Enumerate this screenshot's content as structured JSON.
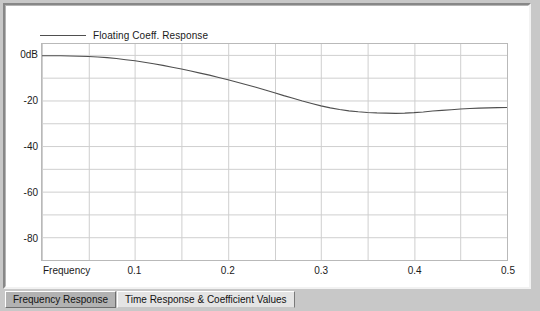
{
  "window": {
    "background_color": "#c8c8c8",
    "panel_background": "#ffffff"
  },
  "legend": {
    "position": "top-left",
    "entries": [
      {
        "label": "Floating Coeff. Response",
        "color": "#4f4f4f",
        "swatch_name": "legend-line-swatch"
      }
    ]
  },
  "axes": {
    "x_title": "Frequency",
    "x_ticks": [
      "0.1",
      "0.2",
      "0.3",
      "0.4",
      "0.5"
    ],
    "x_tick_values": [
      0.1,
      0.2,
      0.3,
      0.4,
      0.5
    ],
    "y_ticks": [
      "0dB",
      "-20",
      "-40",
      "-60",
      "-80"
    ],
    "y_tick_values": [
      0,
      -20,
      -40,
      -60,
      -80
    ]
  },
  "tabs": [
    {
      "label": "Frequency Response",
      "selected": false,
      "name": "tab-frequency-response"
    },
    {
      "label": "Time Response & Coefficient Values",
      "selected": true,
      "name": "tab-time-response-coefficient-values"
    }
  ],
  "chart_data": {
    "type": "line",
    "title": "",
    "subtitle": "",
    "xlabel": "Frequency",
    "ylabel": "",
    "xlim": [
      0.0,
      0.5
    ],
    "ylim": [
      -90,
      5
    ],
    "grid": true,
    "grid_x_step": 0.05,
    "grid_y_step": 10,
    "legend_position": "top-left",
    "series": [
      {
        "name": "Floating Coeff. Response",
        "color": "#4f4f4f",
        "x": [
          0.0,
          0.01,
          0.02,
          0.03,
          0.04,
          0.05,
          0.06,
          0.07,
          0.08,
          0.09,
          0.1,
          0.11,
          0.12,
          0.13,
          0.14,
          0.15,
          0.16,
          0.17,
          0.18,
          0.19,
          0.2,
          0.21,
          0.22,
          0.23,
          0.24,
          0.25,
          0.26,
          0.27,
          0.28,
          0.29,
          0.3,
          0.31,
          0.32,
          0.33,
          0.34,
          0.35,
          0.36,
          0.37,
          0.38,
          0.39,
          0.4,
          0.41,
          0.42,
          0.43,
          0.44,
          0.45,
          0.46,
          0.47,
          0.48,
          0.49,
          0.5
        ],
        "y": [
          -0.2,
          -0.2,
          -0.2,
          -0.3,
          -0.4,
          -0.5,
          -0.7,
          -1.0,
          -1.4,
          -1.9,
          -2.4,
          -3.0,
          -3.7,
          -4.4,
          -5.2,
          -6.0,
          -6.9,
          -7.8,
          -8.7,
          -9.7,
          -10.7,
          -11.8,
          -12.9,
          -14.0,
          -15.2,
          -16.4,
          -17.7,
          -18.9,
          -20.1,
          -21.2,
          -22.2,
          -23.1,
          -23.8,
          -24.4,
          -24.8,
          -25.1,
          -25.3,
          -25.4,
          -25.5,
          -25.4,
          -25.2,
          -24.9,
          -24.5,
          -24.2,
          -23.9,
          -23.6,
          -23.4,
          -23.2,
          -23.1,
          -23.0,
          -22.9
        ]
      }
    ]
  }
}
